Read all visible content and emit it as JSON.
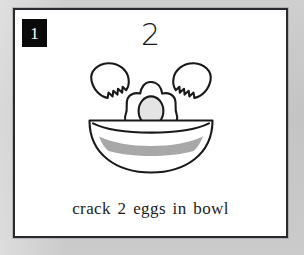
{
  "page": {
    "background_color": "#c9c9c9",
    "card_background_color": "#ffffff",
    "card_border_color": "#2a2a2e"
  },
  "card": {
    "step_badge": {
      "label": "1",
      "background_color": "#0a0a0a",
      "text_color": "#ffffff"
    },
    "quantity_numeral": "2",
    "caption": "crack 2 eggs in bowl",
    "caption_color": "#1b1b1d"
  },
  "illustration": {
    "name": "crack-eggs-in-bowl-illustration",
    "outline_color": "#1a1a1a",
    "fill_color": "#ffffff",
    "shading_color": "#a8a8a8",
    "yolk_fill_color": "#e2e2e2",
    "parts": [
      {
        "name": "eggshell-half-left",
        "description": "cracked eggshell upper-left with jagged zigzag break"
      },
      {
        "name": "eggshell-half-right",
        "description": "cracked eggshell upper-right with jagged zigzag break"
      },
      {
        "name": "egg-white",
        "description": "blobby fried egg white falling into bowl"
      },
      {
        "name": "egg-yolk",
        "description": "oval shaded yolk at center of egg white"
      },
      {
        "name": "bowl",
        "description": "half-circle bowl with rim line"
      },
      {
        "name": "bowl-shading",
        "description": "grey curved shading band inside bowl"
      }
    ]
  }
}
